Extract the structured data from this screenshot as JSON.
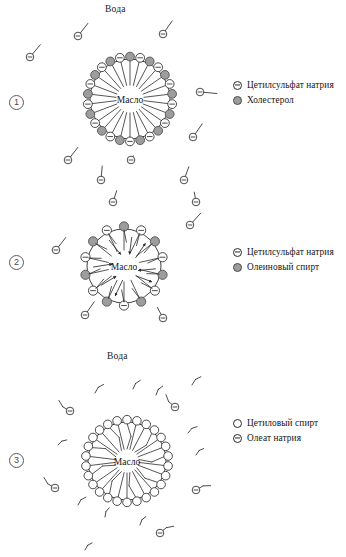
{
  "diagram": {
    "title_phase_water": "Вода",
    "core_label": "Масло",
    "panels": [
      {
        "index": "①",
        "index_plain": "1",
        "water_label": "Вода",
        "core_label": "Масло",
        "legend": [
          {
            "symbol": "anionic-circle-icon",
            "label": "Цетилсульфат натрия"
          },
          {
            "symbol": "filled-circle-icon",
            "label": "Холестерол"
          }
        ],
        "micelle": {
          "head_count": 26,
          "pattern": "alternating",
          "has_exchange_arrows": false,
          "tail_style": "straight"
        }
      },
      {
        "index": "②",
        "index_plain": "2",
        "water_label": "Вода",
        "core_label": "Масло",
        "legend": [
          {
            "symbol": "anionic-circle-icon",
            "label": "Цетилсульфат натрия"
          },
          {
            "symbol": "filled-circle-icon",
            "label": "Олеиновый спирт"
          }
        ],
        "micelle": {
          "head_count": 14,
          "pattern": "alternating",
          "has_exchange_arrows": true,
          "tail_style": "arrow"
        }
      },
      {
        "index": "③",
        "index_plain": "3",
        "water_label": "Вода",
        "core_label": "Масло",
        "legend": [
          {
            "symbol": "plain-circle-icon",
            "label": "Цетиловый спирт"
          },
          {
            "symbol": "anionic-circle-icon",
            "label": "Олеат натрия"
          }
        ],
        "micelle": {
          "head_count": 26,
          "pattern": "all-open",
          "has_exchange_arrows": false,
          "tail_style": "mixed-kinked"
        }
      }
    ],
    "colors": {
      "stroke": "#2b2b2b",
      "fill_gray": "#9d9d9d",
      "fill_white": "#ffffff",
      "text": "#141414",
      "index_ring": "#5a5a5a"
    }
  }
}
